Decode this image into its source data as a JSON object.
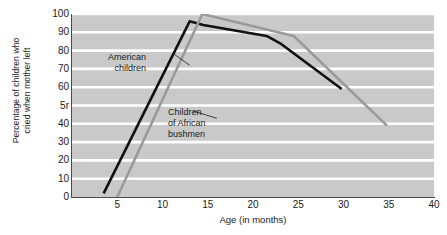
{
  "chart_data": {
    "type": "line",
    "title": "",
    "xlabel": "Age (in months)",
    "ylabel": "Percentage of children who\ncried when mother left",
    "xlim": [
      0,
      40
    ],
    "ylim": [
      0,
      100
    ],
    "xticks": [
      5,
      10,
      15,
      20,
      25,
      30,
      35,
      40
    ],
    "yticks": [
      "0",
      "10",
      "20",
      "30",
      "40",
      "5r",
      "60",
      "70",
      "80",
      "90",
      "100"
    ],
    "ytick_values": [
      0,
      10,
      20,
      30,
      40,
      50,
      60,
      70,
      80,
      90,
      100
    ],
    "grid": "horizontal",
    "legend": "none",
    "plot_background": "#c9c9c9",
    "gridline_color": "#ffffff",
    "series": [
      {
        "name": "American children",
        "color": "#111111",
        "points": [
          {
            "x": 3.5,
            "y": 2
          },
          {
            "x": 13.0,
            "y": 96
          },
          {
            "x": 14.5,
            "y": 94
          },
          {
            "x": 21.5,
            "y": 88
          },
          {
            "x": 23.0,
            "y": 84
          },
          {
            "x": 29.8,
            "y": 59
          }
        ]
      },
      {
        "name": "Children of African bushmen",
        "color": "#9a9a9a",
        "points": [
          {
            "x": 5.0,
            "y": 0
          },
          {
            "x": 14.4,
            "y": 100
          },
          {
            "x": 24.5,
            "y": 88
          },
          {
            "x": 34.8,
            "y": 39
          }
        ]
      }
    ],
    "annotations": [
      {
        "name": "American children",
        "text": "American\nchildren",
        "leader_from": {
          "x": 13.0,
          "y": 72
        },
        "leader_to": {
          "x": 11.3,
          "y": 78
        }
      },
      {
        "name": "Children of African bushmen",
        "text": "Children\nof African\nbushmen",
        "leader_from": {
          "x": 13.4,
          "y": 47
        },
        "leader_to": {
          "x": 16.0,
          "y": 43
        }
      }
    ]
  }
}
